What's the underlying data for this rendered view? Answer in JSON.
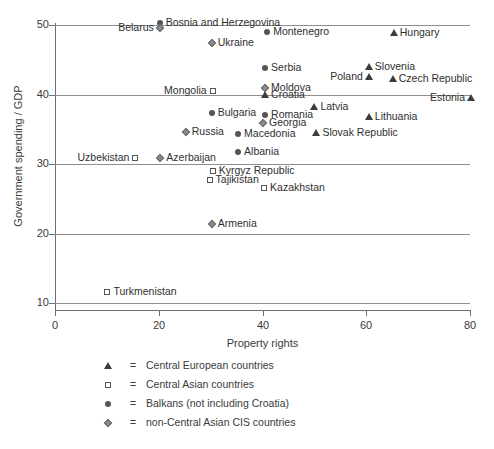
{
  "chart_data": {
    "type": "scatter",
    "title": "",
    "xlabel": "Property rights",
    "ylabel": "Government spending / GDP",
    "xlim": [
      0,
      80
    ],
    "ylim": [
      10,
      50
    ],
    "xticks": [
      0,
      20,
      40,
      60,
      80
    ],
    "yticks": [
      10,
      20,
      30,
      40,
      50
    ],
    "grid": true,
    "legend_position": "below-axes",
    "series": [
      {
        "name": "Central European countries",
        "marker": "triangle",
        "points": [
          {
            "label": "Hungary",
            "x": 65.3,
            "y": 48.8,
            "label_side": "right"
          },
          {
            "label": "Slovenia",
            "x": 60.5,
            "y": 43.9,
            "label_side": "right"
          },
          {
            "label": "Poland",
            "x": 60.5,
            "y": 42.5,
            "label_side": "left"
          },
          {
            "label": "Czech Republic",
            "x": 65.1,
            "y": 42.2,
            "label_side": "right"
          },
          {
            "label": "Estonia",
            "x": 80.2,
            "y": 39.5,
            "label_side": "left"
          },
          {
            "label": "Croatia",
            "x": 40.5,
            "y": 39.9,
            "label_side": "right"
          },
          {
            "label": "Latvia",
            "x": 50.0,
            "y": 38.2,
            "label_side": "right"
          },
          {
            "label": "Lithuania",
            "x": 60.5,
            "y": 36.8,
            "label_side": "right"
          },
          {
            "label": "Slovak Republic",
            "x": 50.4,
            "y": 34.5,
            "label_side": "right"
          }
        ]
      },
      {
        "name": "Central Asian countries",
        "marker": "square",
        "points": [
          {
            "label": "Mongolia",
            "x": 30.4,
            "y": 40.5,
            "label_side": "left"
          },
          {
            "label": "Uzbekistan",
            "x": 15.5,
            "y": 30.9,
            "label_side": "left"
          },
          {
            "label": "Kyrgyz Republic",
            "x": 30.4,
            "y": 29.0,
            "label_side": "right"
          },
          {
            "label": "Tajikistan",
            "x": 29.8,
            "y": 27.7,
            "label_side": "right"
          },
          {
            "label": "Kazakhstan",
            "x": 40.3,
            "y": 26.6,
            "label_side": "right"
          },
          {
            "label": "Turkmenistan",
            "x": 10.1,
            "y": 11.6,
            "label_side": "right"
          }
        ]
      },
      {
        "name": "Balkans (not including Croatia)",
        "marker": "circle",
        "points": [
          {
            "label": "Bosnia and Herzegovina",
            "x": 20.2,
            "y": 50.3,
            "label_side": "right"
          },
          {
            "label": "Montenegro",
            "x": 40.9,
            "y": 49.0,
            "label_side": "right"
          },
          {
            "label": "Serbia",
            "x": 40.5,
            "y": 43.8,
            "label_side": "right"
          },
          {
            "label": "Bulgaria",
            "x": 30.2,
            "y": 37.3,
            "label_side": "right"
          },
          {
            "label": "Romania",
            "x": 40.5,
            "y": 37.1,
            "label_side": "right"
          },
          {
            "label": "Macedonia",
            "x": 35.3,
            "y": 34.3,
            "label_side": "right"
          },
          {
            "label": "Albania",
            "x": 35.3,
            "y": 31.7,
            "label_side": "right"
          }
        ]
      },
      {
        "name": "non-Central Asian CIS countries",
        "marker": "diamond",
        "points": [
          {
            "label": "Belarus",
            "x": 20.2,
            "y": 49.6,
            "label_side": "left"
          },
          {
            "label": "Ukraine",
            "x": 30.2,
            "y": 47.4,
            "label_side": "right"
          },
          {
            "label": "Moldova",
            "x": 40.5,
            "y": 40.9,
            "label_side": "right"
          },
          {
            "label": "Georgia",
            "x": 40.1,
            "y": 35.9,
            "label_side": "right"
          },
          {
            "label": "Russia",
            "x": 25.2,
            "y": 34.6,
            "label_side": "right"
          },
          {
            "label": "Azerbaijan",
            "x": 20.3,
            "y": 30.9,
            "label_side": "right"
          },
          {
            "label": "Armenia",
            "x": 30.2,
            "y": 21.4,
            "label_side": "right"
          }
        ]
      }
    ]
  },
  "legend": {
    "equals": "=",
    "entries": [
      {
        "marker": "triangle",
        "text": "Central European countries"
      },
      {
        "marker": "square",
        "text": "Central Asian countries"
      },
      {
        "marker": "circle",
        "text": "Balkans (not including Croatia)"
      },
      {
        "marker": "diamond",
        "text": "non-Central Asian CIS countries"
      }
    ]
  },
  "caption": ""
}
